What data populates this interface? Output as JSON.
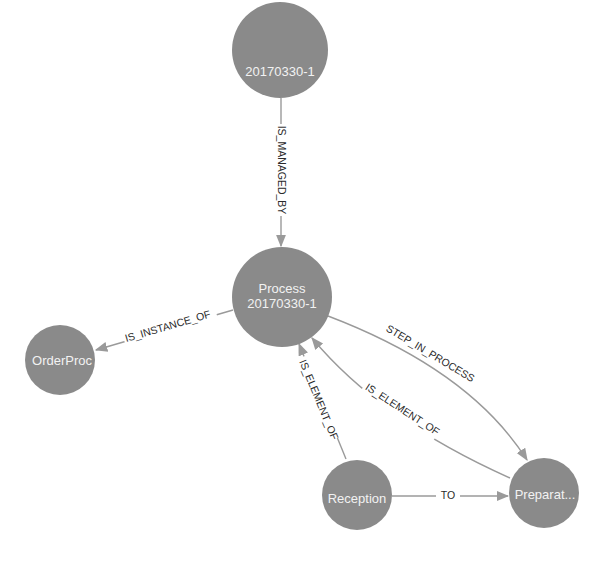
{
  "colors": {
    "node_fill": "#8a8a8a",
    "node_text": "#f2f2f2",
    "edge": "#9a9a9a",
    "edge_text": "#2a2a2a",
    "background": "#ffffff"
  },
  "nodes": [
    {
      "id": "n_instance",
      "label": "20170330-1",
      "lines": [
        "20170330-1"
      ],
      "x": 280,
      "y": 50,
      "r": 48
    },
    {
      "id": "n_process",
      "label": "Process 20170330-1",
      "lines": [
        "Process",
        "20170330-1"
      ],
      "x": 282,
      "y": 297,
      "r": 50
    },
    {
      "id": "n_orderproc",
      "label": "OrderProc",
      "lines": [
        "OrderProc"
      ],
      "x": 60,
      "y": 360,
      "r": 35
    },
    {
      "id": "n_reception",
      "label": "Reception",
      "lines": [
        "Reception"
      ],
      "x": 357,
      "y": 493,
      "r": 35
    },
    {
      "id": "n_preparat",
      "label": "Preparat...",
      "lines": [
        "Preparat..."
      ],
      "x": 544,
      "y": 492,
      "r": 35
    }
  ],
  "edges": [
    {
      "id": "e1",
      "label": "IS_MANAGED_BY",
      "from": "n_instance",
      "to": "n_process"
    },
    {
      "id": "e2",
      "label": "IS_INSTANCE_OF",
      "from": "n_process",
      "to": "n_orderproc"
    },
    {
      "id": "e3",
      "label": "STEP_IN_PROCESS",
      "from": "n_process",
      "to": "n_preparat"
    },
    {
      "id": "e4",
      "label": "IS_ELEMENT_OF",
      "from": "n_preparat",
      "to": "n_process"
    },
    {
      "id": "e5",
      "label": "IS_ELEMENT_OF",
      "from": "n_reception",
      "to": "n_process"
    },
    {
      "id": "e6",
      "label": "TO",
      "from": "n_reception",
      "to": "n_preparat"
    }
  ]
}
